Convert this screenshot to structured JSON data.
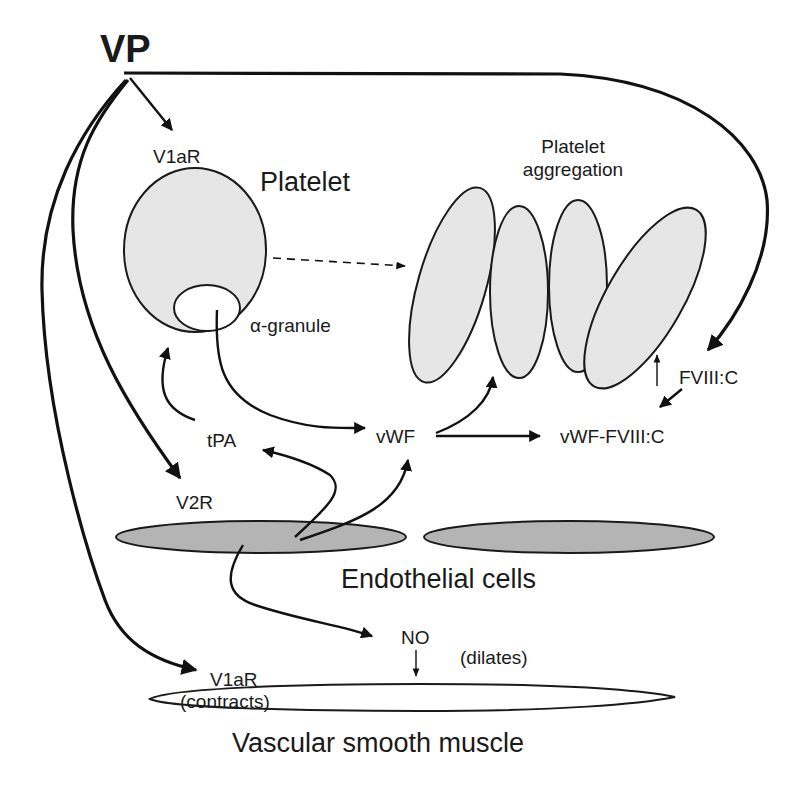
{
  "diagram": {
    "title": "VP",
    "nodes": {
      "v1ar_platelet": "V1aR",
      "platelet": "Platelet",
      "alpha_granule": "α-granule",
      "platelet_aggregation_line1": "Platelet",
      "platelet_aggregation_line2": "aggregation",
      "fviii_c": "FVIII:C",
      "vwf_fviii_c": "vWF-FVIII:C",
      "vwf": "vWF",
      "tpa": "tPA",
      "v2r": "V2R",
      "endothelial_cells": "Endothelial cells",
      "no": "NO",
      "dilates": "(dilates)",
      "v1ar_muscle": "V1aR",
      "contracts": "(contracts)",
      "vascular_smooth_muscle": "Vascular smooth muscle"
    },
    "edges": [
      {
        "from": "VP",
        "to": "V1aR (platelet)",
        "style": "solid"
      },
      {
        "from": "VP",
        "to": "FVIII:C",
        "style": "solid"
      },
      {
        "from": "VP",
        "to": "V2R",
        "style": "solid"
      },
      {
        "from": "VP",
        "to": "V1aR (vascular smooth muscle)",
        "style": "solid"
      },
      {
        "from": "Platelet",
        "to": "Platelet aggregation",
        "style": "dashed"
      },
      {
        "from": "α-granule",
        "to": "vWF",
        "style": "solid"
      },
      {
        "from": "tPA",
        "to": "Platelet",
        "style": "solid"
      },
      {
        "from": "Endothelial cells",
        "to": "tPA",
        "style": "solid"
      },
      {
        "from": "Endothelial cells",
        "to": "vWF",
        "style": "solid"
      },
      {
        "from": "vWF",
        "to": "Platelet aggregation",
        "style": "solid"
      },
      {
        "from": "vWF",
        "to": "vWF-FVIII:C",
        "style": "solid"
      },
      {
        "from": "FVIII:C",
        "to": "vWF-FVIII:C",
        "style": "solid"
      },
      {
        "from": "FVIII:C",
        "to": "Platelet aggregation",
        "style": "thin"
      },
      {
        "from": "Endothelial cells",
        "to": "NO",
        "style": "solid"
      },
      {
        "from": "NO",
        "to": "Vascular smooth muscle",
        "style": "thin"
      }
    ],
    "colors": {
      "platelet_fill": "#e6e6e6",
      "endothelial_fill": "#b4b4b4",
      "muscle_fill": "#ffffff",
      "stroke": "#1a1a1a"
    }
  }
}
